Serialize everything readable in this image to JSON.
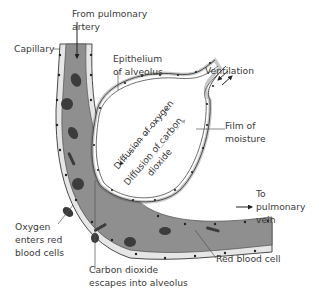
{
  "diagram": {
    "type": "biology-gas-exchange-alveolus",
    "labels": {
      "from_pulmonary_artery": [
        "From pulmonary",
        "artery"
      ],
      "capillary": "Capillary",
      "epithelium": [
        "Epithelium",
        "of alveolus"
      ],
      "ventilation": "Ventilation",
      "film_of_moisture": [
        "Film of",
        "moisture"
      ],
      "diffusion_oxygen": "Diffusion of oxygen",
      "diffusion_co2": [
        "Diffusion of carbon",
        "dioxide"
      ],
      "to_pulmonary_vein": [
        "To",
        "pulmonary",
        "vein"
      ],
      "oxygen_enters": [
        "Oxygen",
        "enters red",
        "blood cells"
      ],
      "co2_escapes": [
        "Carbon dioxide",
        "escapes into alveolus"
      ],
      "red_blood_cell": "Red blood cell"
    },
    "colors": {
      "capillary_fill": "#8f8f8f",
      "cell_dark": "#3c3c3c",
      "epithelium_fill": "#e6e6e6",
      "outline": "#4a4a4a",
      "text": "#3a3a3a"
    }
  }
}
